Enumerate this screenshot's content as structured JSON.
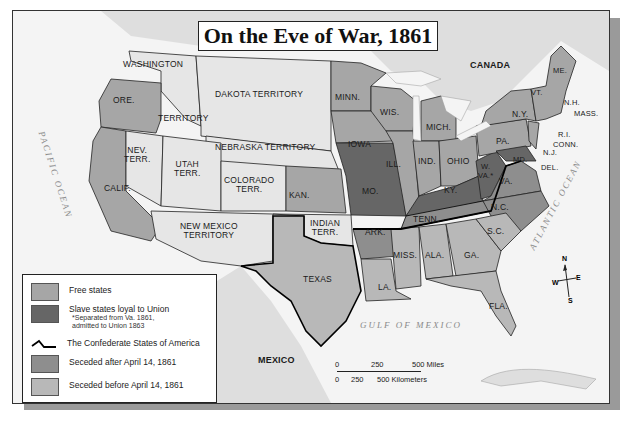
{
  "map": {
    "title": "On the Eve of War, 1861",
    "colors": {
      "free_states": "#a6a6a6",
      "slave_loyal": "#666666",
      "seceded_after": "#8e8e8e",
      "seceded_before": "#b8b8b8",
      "territory": "#e6e6e6",
      "water": "#f4f4f4",
      "foreign_land": "#dedede"
    },
    "region_labels": {
      "washington": "WASHINGTON",
      "territory": "TERRITORY",
      "dakota": "DAKOTA TERRITORY",
      "nebraska": "NEBRASKA TERRITORY",
      "ore": "ORE.",
      "nev": "NEV.\nTERR.",
      "utah": "UTAH\nTERR.",
      "colorado": "COLORADO\nTERR.",
      "calif": "CALIF.",
      "new_mexico": "NEW MEXICO\nTERRITORY",
      "indian": "INDIAN\nTERR.",
      "texas": "TEXAS",
      "kan": "KAN.",
      "minn": "MINN.",
      "iowa": "IOWA",
      "mo": "MO.",
      "wis": "WIS.",
      "ill": "ILL.",
      "mich": "MICH.",
      "ind": "IND.",
      "ohio": "OHIO",
      "ky": "KY.",
      "tenn": "TENN.",
      "ark": "ARK.",
      "la": "LA.",
      "miss": "MISS.",
      "ala": "ALA.",
      "ga": "GA.",
      "sc": "S.C.",
      "nc": "N.C.",
      "va": "VA.",
      "wva": "W.\nVA.*",
      "md": "MD.",
      "del": "DEL.",
      "pa": "PA.",
      "nj": "N.J.",
      "ny": "N.Y.",
      "conn": "CONN.",
      "ri": "R.I.",
      "mass": "MASS.",
      "nh": "N.H.",
      "vt": "VT.",
      "me": "ME.",
      "fla": "FLA.",
      "canada": "CANADA",
      "mexico": "MEXICO"
    },
    "water_labels": {
      "pacific": "PACIFIC  OCEAN",
      "atlantic": "ATLANTIC  OCEAN",
      "gulf": "GULF  OF  MEXICO"
    },
    "legend": {
      "items": [
        {
          "label": "Free states",
          "note": ""
        },
        {
          "label": "Slave states loyal to Union",
          "note": "*Separated from Va. 1861,\nadmitted to Union 1863"
        },
        {
          "label": "The Confederate States of America",
          "note": ""
        },
        {
          "label": "Seceded after April 14, 1861",
          "note": ""
        },
        {
          "label": "Seceded before April 14, 1861",
          "note": ""
        }
      ]
    },
    "scale": {
      "miles_ticks": [
        "0",
        "250",
        "500 Miles"
      ],
      "km_ticks": [
        "0",
        "250",
        "500 Kilometers"
      ]
    },
    "compass": {
      "n": "N",
      "s": "S",
      "e": "E",
      "w": "W"
    }
  }
}
